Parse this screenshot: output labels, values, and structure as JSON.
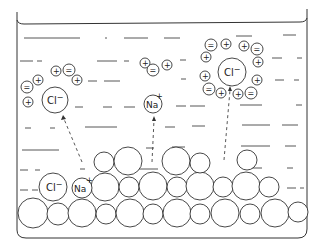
{
  "diagram": {
    "labels": {
      "chloride": "Cl",
      "chloride_charge": "−",
      "sodium": "Na",
      "sodium_charge": "+",
      "water_positive": "+",
      "water_negative": "="
    },
    "colors": {
      "line": "#333333",
      "background": "#ffffff"
    },
    "ions": [
      {
        "type": "chloride",
        "location": "hydrated-left",
        "x": 55,
        "y": 99,
        "r": 13
      },
      {
        "type": "sodium",
        "location": "hydrated-center",
        "x": 153,
        "y": 104,
        "r": 9
      },
      {
        "type": "chloride",
        "location": "hydrated-right",
        "x": 232,
        "y": 72,
        "r": 14
      },
      {
        "type": "chloride",
        "location": "crystal-surface",
        "x": 53,
        "y": 187,
        "r": 14
      },
      {
        "type": "sodium",
        "location": "crystal-surface",
        "x": 82,
        "y": 188,
        "r": 10
      }
    ],
    "arrows": [
      {
        "from": "crystal",
        "to": "chloride-left",
        "x1": 82,
        "y1": 163,
        "x2": 64,
        "y2": 117
      },
      {
        "from": "crystal",
        "to": "sodium-center",
        "x1": 152,
        "y1": 163,
        "x2": 154,
        "y2": 118
      },
      {
        "from": "crystal",
        "to": "chloride-right",
        "x1": 224,
        "y1": 160,
        "x2": 230,
        "y2": 88
      }
    ]
  }
}
